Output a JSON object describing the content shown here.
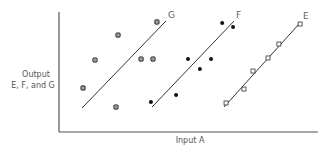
{
  "chart_data": {
    "type": "scatter",
    "title": "",
    "xlabel": "Input A",
    "ylabel": "Output E, F, and G",
    "ylabel_lines": [
      "Output",
      "E, F, and G"
    ],
    "xlim": [
      0,
      100
    ],
    "ylim": [
      0,
      100
    ],
    "grid": false,
    "ticks": false,
    "legend": "inline labels at line ends",
    "series": [
      {
        "name": "G",
        "marker": "circled-plus",
        "points": [
          [
            9.3,
            36.7
          ],
          [
            13.9,
            60.0
          ],
          [
            22.8,
            80.8
          ],
          [
            22.0,
            20.8
          ],
          [
            31.7,
            60.8
          ],
          [
            36.3,
            60.8
          ],
          [
            37.8,
            91.7
          ]
        ],
        "fit_line": [
          [
            8.9,
            20.0
          ],
          [
            41.3,
            92.5
          ]
        ]
      },
      {
        "name": "F",
        "marker": "filled-dot",
        "points": [
          [
            35.5,
            25.0
          ],
          [
            45.2,
            30.8
          ],
          [
            49.8,
            60.8
          ],
          [
            54.4,
            52.5
          ],
          [
            58.7,
            60.8
          ],
          [
            63.0,
            90.8
          ],
          [
            67.2,
            87.5
          ]
        ],
        "fit_line": [
          [
            35.9,
            20.8
          ],
          [
            67.6,
            92.5
          ]
        ]
      },
      {
        "name": "E",
        "marker": "open-square",
        "points": [
          [
            64.5,
            24.2
          ],
          [
            71.4,
            35.8
          ],
          [
            74.9,
            50.8
          ],
          [
            80.7,
            61.7
          ],
          [
            84.9,
            73.3
          ],
          [
            93.1,
            90.0
          ]
        ],
        "fit_line": [
          [
            63.7,
            20.8
          ],
          [
            93.4,
            91.7
          ]
        ]
      }
    ]
  }
}
